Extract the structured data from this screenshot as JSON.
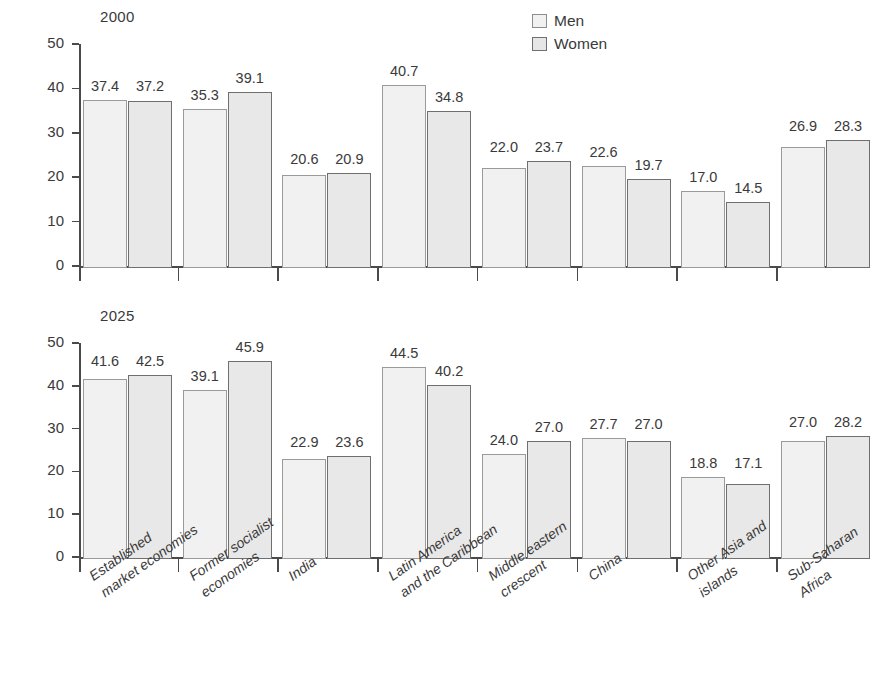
{
  "axis": {
    "y_label": "Rate of hypertension (%)",
    "y_ticks": [
      "0",
      "10",
      "20",
      "30",
      "40",
      "50"
    ]
  },
  "legend": {
    "men_label": "Men",
    "women_label": "Women",
    "men_color": "#f1f1f1",
    "women_color": "#e8e8e8"
  },
  "panels": [
    {
      "title": "2000"
    },
    {
      "title": "2025"
    }
  ],
  "categories": [
    "Established\nmarket economies",
    "Former socialist\neconomies",
    "India",
    "Latin America\nand the Caribbean",
    "Middle eastern\ncrescent",
    "China",
    "Other Asia and\nislands",
    "Sub-Saharan\nAfrica"
  ],
  "chart_data": {
    "type": "bar",
    "xlabel": "",
    "ylabel": "Rate of hypertension (%)",
    "ylim": [
      0,
      50
    ],
    "yticks": [
      0,
      10,
      20,
      30,
      40,
      50
    ],
    "grid": false,
    "legend_position": "top-right",
    "categories": [
      "Established market economies",
      "Former socialist economies",
      "India",
      "Latin America and the Caribbean",
      "Middle eastern crescent",
      "China",
      "Other Asia and islands",
      "Sub-Saharan Africa"
    ],
    "panels": [
      {
        "title": "2000",
        "series": [
          {
            "name": "Men",
            "values": [
              37.4,
              35.3,
              20.6,
              40.7,
              22.0,
              22.6,
              17.0,
              26.9
            ]
          },
          {
            "name": "Women",
            "values": [
              37.2,
              39.1,
              20.9,
              34.8,
              23.7,
              19.7,
              14.5,
              28.3
            ]
          }
        ]
      },
      {
        "title": "2025",
        "series": [
          {
            "name": "Men",
            "values": [
              41.6,
              39.1,
              22.9,
              44.5,
              24.0,
              27.7,
              18.8,
              27.0
            ]
          },
          {
            "name": "Women",
            "values": [
              42.5,
              45.9,
              23.6,
              40.2,
              27.0,
              27.0,
              17.1,
              28.2
            ]
          }
        ]
      }
    ]
  }
}
